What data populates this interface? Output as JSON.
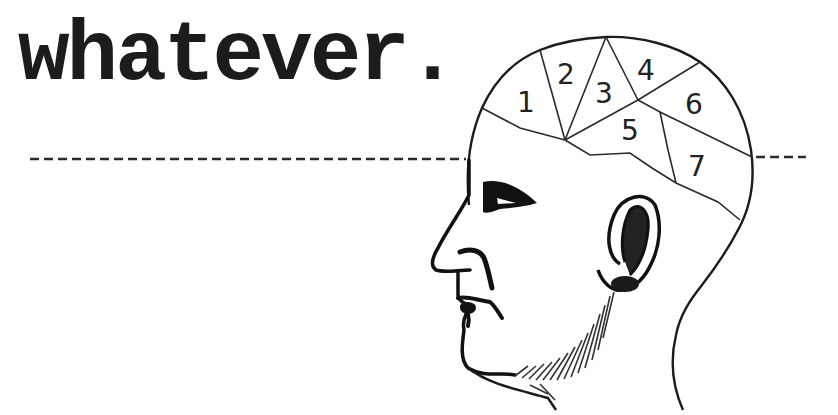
{
  "title": {
    "text": "whatever."
  },
  "illustration": {
    "subject": "phrenology-head-profile",
    "line_color": "#1c1c1c",
    "background": "#ffffff",
    "regions": [
      {
        "id": 1,
        "label": "1"
      },
      {
        "id": 2,
        "label": "2"
      },
      {
        "id": 3,
        "label": "3"
      },
      {
        "id": 4,
        "label": "4"
      },
      {
        "id": 5,
        "label": "5"
      },
      {
        "id": 6,
        "label": "6"
      },
      {
        "id": 7,
        "label": "7"
      }
    ]
  },
  "divider": {
    "style": "dashed"
  }
}
